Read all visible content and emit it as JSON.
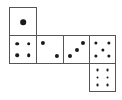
{
  "diagram": {
    "title": "",
    "type": "die-net",
    "border_color": "#555555",
    "pip_color": "#1a1a1a",
    "faces": [
      {
        "id": "face-1",
        "value": 1,
        "x": 9,
        "y": 7,
        "w": 28,
        "h": 29,
        "pips": [
          {
            "cx": 50,
            "cy": 52,
            "r": 10
          }
        ]
      },
      {
        "id": "face-4",
        "value": 4,
        "x": 9,
        "y": 35,
        "w": 28,
        "h": 29,
        "pips": [
          {
            "cx": 28,
            "cy": 28,
            "r": 6.5
          },
          {
            "cx": 72,
            "cy": 28,
            "r": 6.5
          },
          {
            "cx": 28,
            "cy": 72,
            "r": 6.5
          },
          {
            "cx": 72,
            "cy": 72,
            "r": 6.5
          }
        ]
      },
      {
        "id": "face-2",
        "value": 2,
        "x": 36,
        "y": 35,
        "w": 28,
        "h": 29,
        "pips": [
          {
            "cx": 24,
            "cy": 26,
            "r": 7.5
          },
          {
            "cx": 76,
            "cy": 74,
            "r": 7.5
          }
        ]
      },
      {
        "id": "face-3",
        "value": 3,
        "x": 63,
        "y": 35,
        "w": 27,
        "h": 29,
        "pips": [
          {
            "cx": 24,
            "cy": 74,
            "r": 7.5
          },
          {
            "cx": 50,
            "cy": 50,
            "r": 7.5
          },
          {
            "cx": 76,
            "cy": 26,
            "r": 7.5
          }
        ]
      },
      {
        "id": "face-5",
        "value": 5,
        "x": 89,
        "y": 35,
        "w": 27,
        "h": 29,
        "pips": [
          {
            "cx": 25,
            "cy": 25,
            "r": 6
          },
          {
            "cx": 75,
            "cy": 25,
            "r": 6
          },
          {
            "cx": 50,
            "cy": 50,
            "r": 6
          },
          {
            "cx": 25,
            "cy": 75,
            "r": 6
          },
          {
            "cx": 75,
            "cy": 75,
            "r": 6
          }
        ]
      },
      {
        "id": "face-6",
        "value": 6,
        "x": 89,
        "y": 63,
        "w": 27,
        "h": 29,
        "pips": [
          {
            "cx": 30,
            "cy": 22,
            "r": 5.5
          },
          {
            "cx": 70,
            "cy": 22,
            "r": 5.5
          },
          {
            "cx": 30,
            "cy": 50,
            "r": 5.5
          },
          {
            "cx": 70,
            "cy": 50,
            "r": 5.5
          },
          {
            "cx": 30,
            "cy": 78,
            "r": 5.5
          },
          {
            "cx": 70,
            "cy": 78,
            "r": 5.5
          }
        ]
      }
    ]
  }
}
